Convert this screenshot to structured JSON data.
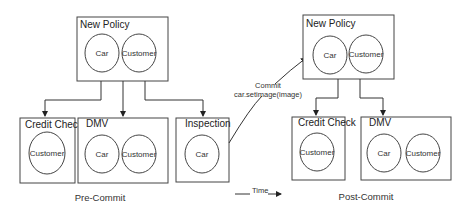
{
  "pre_commit": {
    "label": "Pre-Commit",
    "root": {
      "title": "New Policy",
      "objects": [
        "Car",
        "Customer"
      ]
    },
    "children": [
      {
        "title": "Credit Check",
        "objects": [
          "Customer"
        ]
      },
      {
        "title": "DMV",
        "objects": [
          "Car",
          "Customer"
        ]
      },
      {
        "title": "Inspection",
        "objects": [
          "Car"
        ]
      }
    ]
  },
  "post_commit": {
    "label": "Post-Commit",
    "root": {
      "title": "New Policy",
      "objects": [
        "Car",
        "Customer"
      ]
    },
    "children": [
      {
        "title": "Credit Check",
        "objects": [
          "Customer"
        ]
      },
      {
        "title": "DMV",
        "objects": [
          "Car",
          "Customer"
        ]
      }
    ]
  },
  "commit_arrow": {
    "line1": "Commit",
    "line2": "car.setimage(image)"
  },
  "time_arrow": {
    "label": "Time"
  }
}
